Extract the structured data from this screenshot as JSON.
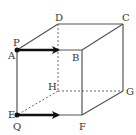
{
  "figure": {
    "type": "cube-diagram",
    "vertices": {
      "A": {
        "label": "A",
        "x": 17,
        "y": 50
      },
      "B": {
        "label": "B",
        "x": 82,
        "y": 50
      },
      "C": {
        "label": "C",
        "x": 123,
        "y": 24
      },
      "D": {
        "label": "D",
        "x": 58,
        "y": 24
      },
      "E": {
        "label": "E",
        "x": 17,
        "y": 115
      },
      "F": {
        "label": "F",
        "x": 82,
        "y": 115
      },
      "G": {
        "label": "G",
        "x": 123,
        "y": 91
      },
      "H": {
        "label": "H",
        "x": 58,
        "y": 91
      }
    },
    "points": {
      "P": {
        "label": "P",
        "on": "A"
      },
      "Q": {
        "label": "Q",
        "on": "E"
      }
    },
    "arrows": [
      {
        "name": "arrow-p",
        "from": "P",
        "direction": "toward B"
      },
      {
        "name": "arrow-q",
        "from": "Q",
        "direction": "toward F"
      }
    ],
    "hidden_edges": [
      "D-H",
      "H-E",
      "H-G"
    ],
    "colors": {
      "line": "#555555",
      "arrow": "#111111",
      "label": "#333333"
    }
  }
}
